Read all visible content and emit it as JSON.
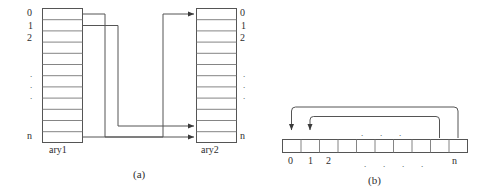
{
  "figure": {
    "title_a": "(a)",
    "title_b": "(b)",
    "panel_a": {
      "left_array": {
        "name": "ary1",
        "cells": 12,
        "index_labels": [
          "0",
          "1",
          "2",
          "n"
        ],
        "ellipsis": "."
      },
      "right_array": {
        "name": "ary2",
        "cells": 12,
        "index_labels": [
          "0",
          "1",
          "2",
          "n"
        ],
        "ellipsis": "."
      },
      "connections": [
        {
          "from_index": "0",
          "to_index": "n"
        },
        {
          "from_index": "1",
          "to_index": "n-1"
        },
        {
          "from_index": "n",
          "to_index": "0"
        }
      ]
    },
    "panel_b": {
      "cells": 10,
      "index_labels": [
        "0",
        "1",
        "2",
        "n"
      ],
      "ellipsis": ".",
      "dots_count_above": 3,
      "dots_count_below": 4,
      "connections": [
        {
          "from_index": "n",
          "to_index": "0"
        },
        {
          "from_index": "n-1",
          "to_index": "1"
        }
      ]
    },
    "colors": {
      "stroke": "#555555",
      "text": "#2e2e2e",
      "background": "#ffffff"
    }
  }
}
